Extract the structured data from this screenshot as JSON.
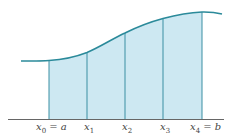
{
  "diagram": {
    "type": "riemann-partition",
    "colors": {
      "fill": "#cde8f2",
      "curve": "#2b8a9a",
      "partition_lines": "#3a8fa3",
      "axis": "#666666",
      "label": "#444444"
    },
    "axis": {
      "x_start": 8,
      "x_end": 224,
      "y": 119.5
    },
    "curve_path": "M 21 61 C 35 61, 45 61, 49 60.5 C 65 59.5, 78 56, 87 52.5 C 100 47, 112 39, 125 33 C 138 26.5, 150 22, 163 18.5 C 176 15, 190 12.5, 202 12 C 212 11.8, 218 13, 222 14",
    "area_path": "M 49 60.5 C 65 59.5, 78 56, 87 52.5 C 100 47, 112 39, 125 33 C 138 26.5, 150 22, 163 18.5 C 176 15, 190 12.5, 202 12 L 202 119.5 L 49 119.5 Z",
    "partition_points": [
      {
        "x": 49,
        "curve_y": 60.5,
        "var": "x",
        "sub": "0",
        "suffix": " = a",
        "label_x": 36
      },
      {
        "x": 87,
        "curve_y": 52.5,
        "var": "x",
        "sub": "1",
        "suffix": "",
        "label_x": 84
      },
      {
        "x": 125,
        "curve_y": 33,
        "var": "x",
        "sub": "2",
        "suffix": "",
        "label_x": 122
      },
      {
        "x": 163,
        "curve_y": 18.5,
        "var": "x",
        "sub": "3",
        "suffix": "",
        "label_x": 160
      },
      {
        "x": 202,
        "curve_y": 12,
        "var": "x",
        "sub": "4",
        "suffix": " = b",
        "label_x": 190
      }
    ],
    "labels": [
      "x0 = a",
      "x1",
      "x2",
      "x3",
      "x4 = b"
    ],
    "label_y": 130
  }
}
